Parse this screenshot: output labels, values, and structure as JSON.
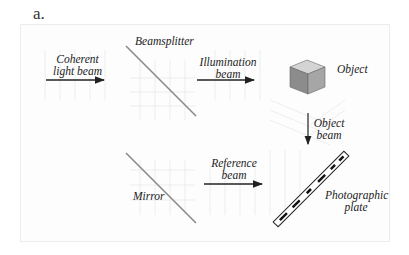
{
  "panel_label": "a.",
  "labels": {
    "coherent": [
      "Coherent",
      "light beam"
    ],
    "beamsplitter": "Beamsplitter",
    "illumination": [
      "Illumination",
      "beam"
    ],
    "object": "Object",
    "object_beam": [
      "Object",
      "beam"
    ],
    "reference": [
      "Reference",
      "beam"
    ],
    "mirror": "Mirror",
    "plate": [
      "Photographic",
      "plate"
    ]
  },
  "colors": {
    "line": "#222222",
    "optic": "#8a8a8a",
    "grid": "#e6e6e6",
    "cube_front": "#8c8c8c",
    "cube_side": "#a6a6a6",
    "cube_top": "#d4d4d4"
  }
}
